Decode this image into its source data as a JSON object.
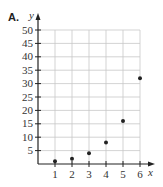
{
  "problem_label": "A.",
  "colors": {
    "axis": "#222222",
    "grid": "#c8c8c8",
    "point": "#222222",
    "text": "#333333"
  },
  "chart_data": {
    "type": "scatter",
    "title": "",
    "label": "A.",
    "xlabel": "x",
    "ylabel": "y",
    "x": [
      1,
      2,
      3,
      4,
      5,
      6
    ],
    "y": [
      1,
      2,
      4,
      8,
      16,
      32
    ],
    "xlim": [
      0,
      6
    ],
    "ylim": [
      0,
      50
    ],
    "xticks": [
      1,
      2,
      3,
      4,
      5,
      6
    ],
    "yticks": [
      5,
      10,
      15,
      20,
      25,
      30,
      35,
      40,
      45,
      50
    ],
    "grid": true,
    "legend": null
  }
}
